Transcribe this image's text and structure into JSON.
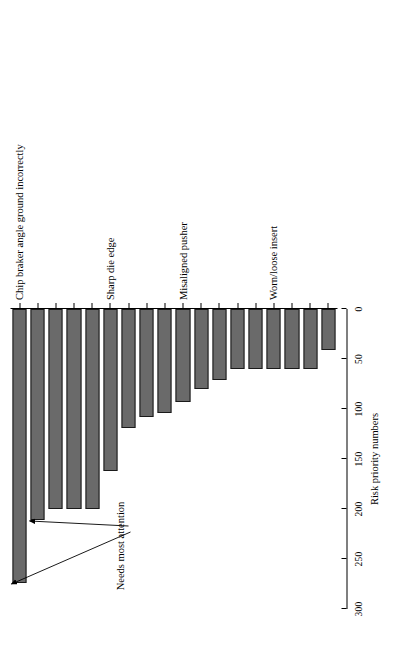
{
  "figure": {
    "orientation": "rotated-90",
    "background_color": "#ffffff",
    "bar_fill_color": "#6a6a6a",
    "bar_border_color": "#1a1a1a",
    "axis_color": "#000000"
  },
  "annotation": {
    "label": "Needs most attention",
    "target_count": 2
  },
  "chart_data": {
    "type": "bar",
    "orientation": "vertical-rotated",
    "title": "",
    "xlabel": "",
    "ylabel": "Risk priority numbers",
    "ylim": [
      0,
      300
    ],
    "yticks": [
      0,
      50,
      100,
      150,
      200,
      250,
      300
    ],
    "ytick_labels": [
      "0",
      "50",
      "100",
      "150",
      "200",
      "250",
      "300"
    ],
    "grid": false,
    "legend": null,
    "categories": [
      "Chip braker angle ground incorrectly",
      "",
      "",
      "",
      "",
      "Sharp die edge",
      "",
      "",
      "",
      "Misaligned pusher",
      "",
      "",
      "",
      "",
      "Worn/loose insert",
      "",
      "",
      ""
    ],
    "labeled_categories": [
      "Chip braker angle ground incorrectly",
      "Sharp die edge",
      "Misaligned pusher",
      "Worn/loose insert"
    ],
    "values": [
      274,
      211,
      200,
      200,
      200,
      162,
      119,
      108,
      104,
      93,
      80,
      71,
      60,
      60,
      60,
      60,
      60,
      41
    ],
    "annotations": [
      {
        "text": "Needs most attention",
        "points_to_values": [
          274,
          211
        ]
      }
    ]
  }
}
